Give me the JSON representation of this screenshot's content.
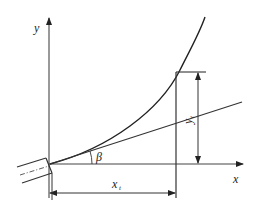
{
  "diagram": {
    "labels": {
      "y_axis": "y",
      "x_axis": "x",
      "angle": "β",
      "x_dim": "x",
      "x_dim_sub": "t",
      "y_dim": "y",
      "y_dim_sub": "t"
    },
    "colors": {
      "stroke": "#333333",
      "axis": "#555555"
    }
  }
}
